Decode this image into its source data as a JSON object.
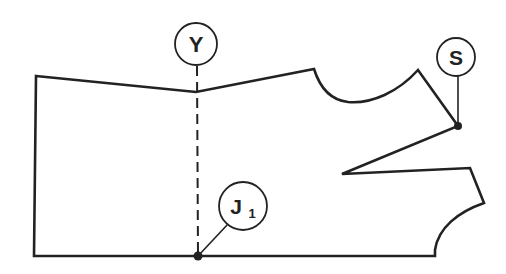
{
  "diagram": {
    "type": "garment pattern piece (bodice draft)",
    "stroke_color": "#222222",
    "background": "#ffffff",
    "labels": [
      {
        "id": "Y",
        "text": "Y",
        "subscript": "",
        "marks": "top of vertical dashed guide line"
      },
      {
        "id": "S",
        "text": "S",
        "subscript": "",
        "marks": "shoulder point at end of shoulder line"
      },
      {
        "id": "J1",
        "text": "J",
        "subscript": "1",
        "marks": "bottom end of vertical dashed guide line on hem line"
      }
    ],
    "points": {
      "top_left": [
        36,
        76
      ],
      "bottom_left": [
        34,
        256
      ],
      "Y_line_top": [
        196,
        92
      ],
      "J1": [
        198,
        256
      ],
      "armhole_start": [
        314,
        69
      ],
      "armhole_end": [
        418,
        70
      ],
      "S": [
        458,
        126
      ],
      "dart_apex": [
        342,
        174
      ],
      "dart_end": [
        470,
        168
      ],
      "side_corner": [
        484,
        203
      ],
      "hem_corner": [
        435,
        250
      ],
      "hem_bottom": [
        435,
        256
      ]
    }
  }
}
